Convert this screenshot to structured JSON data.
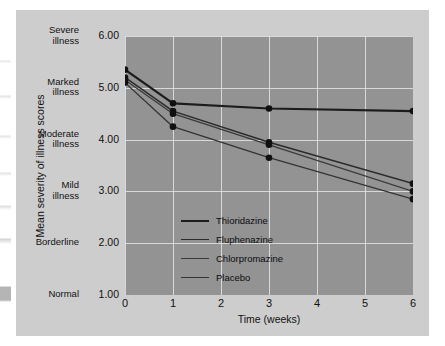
{
  "figure": {
    "y_axis_title": "Mean severity of illness scores",
    "x_axis_title": "Time (weeks)"
  },
  "y_axis": {
    "ticks": [
      {
        "value": "6.00",
        "word_line1": "Severe",
        "word_line2": "illness"
      },
      {
        "value": "5.00",
        "word_line1": "Marked",
        "word_line2": "illness"
      },
      {
        "value": "4.00",
        "word_line1": "Moderate",
        "word_line2": "illness"
      },
      {
        "value": "3.00",
        "word_line1": "Mild",
        "word_line2": "illness"
      },
      {
        "value": "2.00",
        "word_line1": "Borderline",
        "word_line2": ""
      },
      {
        "value": "1.00",
        "word_line1": "Normal",
        "word_line2": ""
      }
    ]
  },
  "x_axis": {
    "ticks": [
      "0",
      "1",
      "2",
      "3",
      "4",
      "5",
      "6"
    ]
  },
  "legend": {
    "entries": [
      {
        "label": "Thioridazine",
        "color": "#1c1c1c",
        "width": "2.2"
      },
      {
        "label": "Fluphenazine",
        "color": "#2b2b2b",
        "width": "1.5"
      },
      {
        "label": "Chlorpromazine",
        "color": "#3a3a3a",
        "width": "1.3"
      },
      {
        "label": "Placebo",
        "color": "#333333",
        "width": "1.3"
      }
    ]
  },
  "chart_data": {
    "type": "line",
    "title": "",
    "xlabel": "Time (weeks)",
    "ylabel": "Mean severity of illness scores",
    "x": [
      0,
      1,
      3,
      6
    ],
    "xlim": [
      0,
      6
    ],
    "ylim": [
      1.0,
      6.0
    ],
    "xticks": [
      0,
      1,
      2,
      3,
      4,
      5,
      6
    ],
    "yticks": [
      1.0,
      2.0,
      3.0,
      4.0,
      5.0,
      6.0
    ],
    "ytick_labels": [
      "Normal 1.00",
      "Borderline 2.00",
      "Mild illness 3.00",
      "Moderate illness 4.00",
      "Marked illness 5.00",
      "Severe illness 6.00"
    ],
    "grid": true,
    "legend_position": "inside-lower-left",
    "markers": "filled-circle",
    "series": [
      {
        "name": "Thioridazine",
        "color": "#1c1c1c",
        "values": [
          5.35,
          4.7,
          4.6,
          4.55
        ]
      },
      {
        "name": "Fluphenazine",
        "color": "#2b2b2b",
        "values": [
          5.2,
          4.55,
          3.95,
          3.15
        ]
      },
      {
        "name": "Chlorpromazine",
        "color": "#3a3a3a",
        "values": [
          5.15,
          4.5,
          3.9,
          3.0
        ]
      },
      {
        "name": "Placebo",
        "color": "#333333",
        "values": [
          5.1,
          4.25,
          3.65,
          2.85
        ]
      }
    ]
  }
}
